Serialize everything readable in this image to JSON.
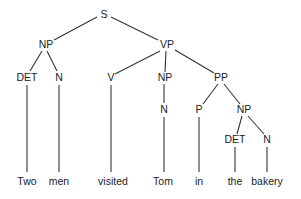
{
  "diagram": {
    "type": "syntax-tree",
    "sentence": "Two men visited Tom in the bakery",
    "nodes": [
      {
        "id": "s",
        "label": "S",
        "x": 104,
        "y": 15
      },
      {
        "id": "np1",
        "label": "NP",
        "x": 46,
        "y": 45
      },
      {
        "id": "vp",
        "label": "VP",
        "x": 167,
        "y": 45
      },
      {
        "id": "det1",
        "label": "DET",
        "x": 27,
        "y": 78
      },
      {
        "id": "n1",
        "label": "N",
        "x": 59,
        "y": 78
      },
      {
        "id": "v",
        "label": "V",
        "x": 111,
        "y": 78
      },
      {
        "id": "np2",
        "label": "NP",
        "x": 165,
        "y": 78
      },
      {
        "id": "pp",
        "label": "PP",
        "x": 221,
        "y": 78
      },
      {
        "id": "n2",
        "label": "N",
        "x": 164,
        "y": 110
      },
      {
        "id": "p",
        "label": "P",
        "x": 199,
        "y": 110
      },
      {
        "id": "np3",
        "label": "NP",
        "x": 244,
        "y": 110
      },
      {
        "id": "det2",
        "label": "DET",
        "x": 235,
        "y": 140
      },
      {
        "id": "n3",
        "label": "N",
        "x": 267,
        "y": 140
      }
    ],
    "words": [
      {
        "text": "Two",
        "x": 27,
        "y": 182
      },
      {
        "text": "men",
        "x": 59,
        "y": 182
      },
      {
        "text": "visited",
        "x": 113,
        "y": 182
      },
      {
        "text": "Tom",
        "x": 163,
        "y": 182
      },
      {
        "text": "in",
        "x": 199,
        "y": 182
      },
      {
        "text": "the",
        "x": 235,
        "y": 182
      },
      {
        "text": "bakery",
        "x": 267,
        "y": 182
      }
    ]
  }
}
